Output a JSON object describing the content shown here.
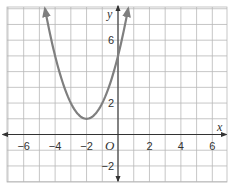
{
  "chart_data": {
    "type": "line",
    "title": "",
    "xlabel": "x",
    "ylabel": "y",
    "origin_label": "O",
    "xlim": [
      -7,
      7
    ],
    "ylim": [
      -3,
      8.5
    ],
    "x_ticks": [
      -6,
      -4,
      -2,
      2,
      4,
      6
    ],
    "x_tick_labels": [
      "−6",
      "−4",
      "−2",
      "2",
      "4",
      "6"
    ],
    "y_ticks": [
      6,
      2,
      -2
    ],
    "y_tick_labels": [
      "6",
      "2",
      "−2"
    ],
    "grid": true,
    "grid_step": 1,
    "series": [
      {
        "name": "parabola",
        "equation": "y = (x + 2)^2 + 1",
        "vertex": [
          -2,
          1
        ],
        "y_intercept": 5,
        "arrows_both_ends": true,
        "color": "#7f7f7f",
        "x_range": [
          -4.65,
          0.65
        ],
        "points": [
          [
            -4.65,
            8.0
          ],
          [
            -4,
            5
          ],
          [
            -3,
            2
          ],
          [
            -2,
            1
          ],
          [
            -1,
            2
          ],
          [
            0,
            5
          ],
          [
            0.65,
            8.0
          ]
        ]
      }
    ]
  },
  "colors": {
    "grid": "#b8b8b8",
    "axis": "#333333",
    "curve": "#7f7f7f",
    "background": "#ffffff"
  }
}
